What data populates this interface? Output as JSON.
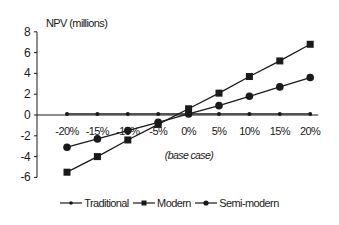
{
  "chart_data": {
    "type": "line",
    "title": "NPV (millions)",
    "xlabel": "(base case)",
    "ylabel": "NPV (millions)",
    "categories": [
      "-20%",
      "-15%",
      "-10%",
      "-5%",
      "0%",
      "5%",
      "10%",
      "15%",
      "20%"
    ],
    "ylim": [
      -6,
      8
    ],
    "yticks": [
      8,
      6,
      4,
      2,
      0,
      -2,
      -4,
      -6
    ],
    "grid": false,
    "legend_position": "bottom",
    "series": [
      {
        "name": "Traditional",
        "marker": "small-diamond",
        "values": [
          0.1,
          0.1,
          0.1,
          0.1,
          0.1,
          0.1,
          0.1,
          0.1,
          0.1
        ]
      },
      {
        "name": "Modern",
        "marker": "square",
        "values": [
          -5.5,
          -4.0,
          -2.4,
          -0.9,
          0.6,
          2.1,
          3.7,
          5.2,
          6.8
        ]
      },
      {
        "name": "Semi-modern",
        "marker": "circle",
        "values": [
          -3.1,
          -2.3,
          -1.5,
          -0.7,
          0.1,
          0.9,
          1.8,
          2.7,
          3.6
        ]
      }
    ],
    "annotations": [
      "(base case)"
    ]
  },
  "legend": {
    "items": [
      {
        "label": "Traditional",
        "icon": "diamond-marker-icon"
      },
      {
        "label": "Modern",
        "icon": "square-marker-icon"
      },
      {
        "label": "Semi-modern",
        "icon": "circle-marker-icon"
      }
    ]
  },
  "colors": {
    "line": "#1a1a1a",
    "background": "#ffffff"
  }
}
